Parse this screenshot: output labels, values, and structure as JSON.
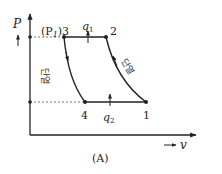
{
  "diagram": {
    "type": "P-v diagram",
    "caption": "(A)",
    "axes": {
      "y_label": "P",
      "x_label": "v",
      "x_arrow": "→"
    },
    "points": [
      {
        "id": "1",
        "label": "1",
        "x": 146,
        "y": 102
      },
      {
        "id": "2",
        "label": "2",
        "x": 106,
        "y": 37
      },
      {
        "id": "3",
        "label": "(P₁)3",
        "x": 64,
        "y": 37
      },
      {
        "id": "4",
        "label": "4",
        "x": 85,
        "y": 102
      }
    ],
    "processes": [
      {
        "from": "1",
        "to": "2",
        "label": "단열",
        "kind": "adiabatic compression"
      },
      {
        "from": "2",
        "to": "3",
        "label": "q₁",
        "kind": "constant pressure"
      },
      {
        "from": "3",
        "to": "4",
        "label": "단열",
        "kind": "adiabatic expansion"
      },
      {
        "from": "4",
        "to": "1",
        "label": "q₂",
        "kind": "constant pressure"
      }
    ],
    "labels": {
      "P": "P",
      "p1": "(P",
      "p1_sub": "1",
      "p1_close": ")3",
      "q1": "q",
      "q1_sub": "1",
      "q2": "q",
      "q2_sub": "2",
      "pt1": "1",
      "pt2": "2",
      "pt4": "4",
      "v": "v",
      "adiabatic_left": "단열",
      "adiabatic_right": "단열",
      "caption": "(A)"
    },
    "colors": {
      "line": "#222222",
      "dotted": "#555555"
    }
  }
}
